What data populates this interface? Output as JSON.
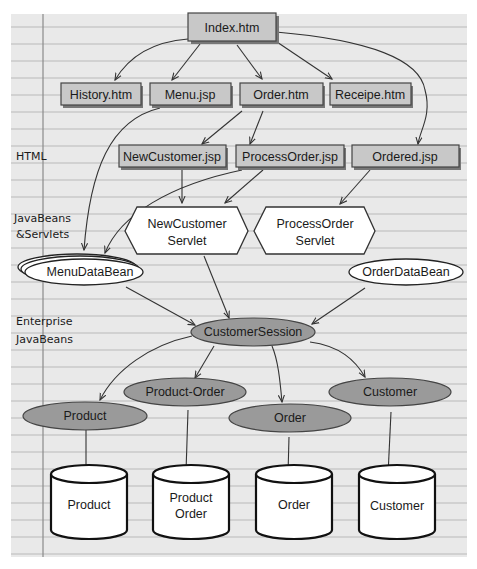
{
  "sections": {
    "html": "HTML",
    "javabeans_1": "JavaBeans",
    "javabeans_2": "&Servlets",
    "ejb_1": "Enterprise",
    "ejb_2": "JavaBeans"
  },
  "pages": {
    "index": "Index.htm",
    "history": "History.htm",
    "menu": "Menu.jsp",
    "order": "Order.htm",
    "receipe": "Receipe.htm",
    "new_customer": "NewCustomer.jsp",
    "process_order": "ProcessOrder.jsp",
    "ordered": "Ordered.jsp"
  },
  "servlets": {
    "new_customer_1": "NewCustomer",
    "new_customer_2": "Servlet",
    "process_order_1": "ProcessOrder",
    "process_order_2": "Servlet"
  },
  "beans": {
    "menu_data": "MenuDataBean",
    "order_data": "OrderDataBean"
  },
  "ejbs": {
    "customer_session": "CustomerSession",
    "product": "Product",
    "product_order": "Product-Order",
    "order": "Order",
    "customer": "Customer"
  },
  "databases": {
    "product": "Product",
    "product_order_1": "Product",
    "product_order_2": "Order",
    "order": "Order",
    "customer": "Customer"
  },
  "colors": {
    "page_bg": "#e9e9e9",
    "rule_line": "#b9b9b9",
    "margin_line": "#8a8a8a",
    "page_box": "#c8c8c8",
    "ejb_fill": "#9a9a9a"
  }
}
